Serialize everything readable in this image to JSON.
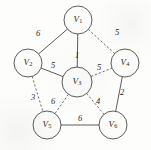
{
  "figure": {
    "type": "weighted-graph-diagram",
    "width": 151,
    "height": 150,
    "background_color": "#fdfdfc",
    "stroke_color": "#4a4a4a",
    "text_color": "#2b2b2b"
  },
  "nodes": [
    {
      "id": "V1",
      "letter": "V",
      "subscript": "1",
      "x": 78,
      "y": 20,
      "r": 14
    },
    {
      "id": "V2",
      "letter": "V",
      "subscript": "2",
      "x": 28,
      "y": 63,
      "r": 14
    },
    {
      "id": "V3",
      "letter": "V",
      "subscript": "3",
      "x": 77,
      "y": 82,
      "r": 15
    },
    {
      "id": "V4",
      "letter": "V",
      "subscript": "4",
      "x": 125,
      "y": 63,
      "r": 14
    },
    {
      "id": "V5",
      "letter": "V",
      "subscript": "5",
      "x": 47,
      "y": 125,
      "r": 14
    },
    {
      "id": "V6",
      "letter": "V",
      "subscript": "6",
      "x": 113,
      "y": 125,
      "r": 14
    }
  ],
  "edges": [
    {
      "id": "e-v1-v2",
      "from": "V1",
      "to": "V2",
      "weight": "6",
      "style": "solid",
      "label_x": 38,
      "label_y": 33
    },
    {
      "id": "e-v1-v4",
      "from": "V1",
      "to": "V4",
      "weight": "5",
      "style": "dashed",
      "label_x": 117,
      "label_y": 32
    },
    {
      "id": "e-v1-v3",
      "from": "V1",
      "to": "V3",
      "weight": "1",
      "style": "solid",
      "label_x": 77,
      "label_y": 55
    },
    {
      "id": "e-v2-v3",
      "from": "V2",
      "to": "V3",
      "weight": "5",
      "style": "solid",
      "label_x": 53,
      "label_y": 65
    },
    {
      "id": "e-v3-v4",
      "from": "V3",
      "to": "V4",
      "weight": "5",
      "style": "dashed",
      "label_x": 99,
      "label_y": 67
    },
    {
      "id": "e-v2-v5",
      "from": "V2",
      "to": "V5",
      "weight": "3",
      "style": "dashed",
      "label_x": 33,
      "label_y": 97
    },
    {
      "id": "e-v3-v5",
      "from": "V3",
      "to": "V5",
      "weight": "6",
      "style": "dashed",
      "label_x": 53,
      "label_y": 101
    },
    {
      "id": "e-v3-v6",
      "from": "V3",
      "to": "V6",
      "weight": "4",
      "style": "dashed",
      "label_x": 98,
      "label_y": 101
    },
    {
      "id": "e-v4-v6",
      "from": "V4",
      "to": "V6",
      "weight": "2",
      "style": "solid",
      "label_x": 122,
      "label_y": 92
    },
    {
      "id": "e-v5-v6",
      "from": "V5",
      "to": "V6",
      "weight": "6",
      "style": "solid",
      "label_x": 80,
      "label_y": 118
    }
  ],
  "chart_data": {
    "type": "diagram",
    "title": "",
    "vertices": [
      "V1",
      "V2",
      "V3",
      "V4",
      "V5",
      "V6"
    ],
    "edge_list": [
      {
        "u": "V1",
        "v": "V2",
        "w": 6,
        "line": "solid"
      },
      {
        "u": "V1",
        "v": "V3",
        "w": 1,
        "line": "solid"
      },
      {
        "u": "V1",
        "v": "V4",
        "w": 5,
        "line": "dashed"
      },
      {
        "u": "V2",
        "v": "V3",
        "w": 5,
        "line": "solid"
      },
      {
        "u": "V2",
        "v": "V5",
        "w": 3,
        "line": "dashed"
      },
      {
        "u": "V3",
        "v": "V4",
        "w": 5,
        "line": "dashed"
      },
      {
        "u": "V3",
        "v": "V5",
        "w": 6,
        "line": "dashed"
      },
      {
        "u": "V3",
        "v": "V6",
        "w": 4,
        "line": "dashed"
      },
      {
        "u": "V4",
        "v": "V6",
        "w": 2,
        "line": "solid"
      },
      {
        "u": "V5",
        "v": "V6",
        "w": 6,
        "line": "solid"
      }
    ]
  }
}
